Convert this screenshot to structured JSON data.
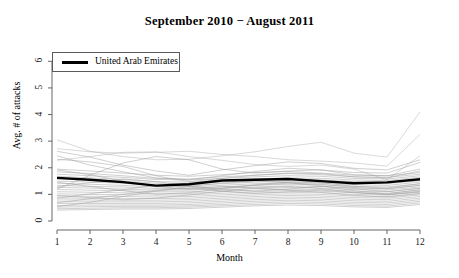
{
  "chart_data": {
    "type": "line",
    "title": "September 2010 − August 2011",
    "xlabel": "Month",
    "ylabel": "Avg. # of attacks",
    "xlim": [
      1,
      12
    ],
    "ylim": [
      0,
      6.5
    ],
    "xticks": [
      "1",
      "2",
      "3",
      "4",
      "5",
      "6",
      "7",
      "8",
      "9",
      "10",
      "11",
      "12"
    ],
    "yticks": [
      "0",
      "1",
      "2",
      "3",
      "4",
      "5",
      "6"
    ],
    "grid": false,
    "legend": {
      "position": "top-left",
      "entries": [
        {
          "label": "United Arab Emirates",
          "color": "#000000",
          "width": 2.5
        }
      ]
    },
    "x": [
      1,
      2,
      3,
      4,
      5,
      6,
      7,
      8,
      9,
      10,
      11,
      12
    ],
    "highlight_series": {
      "name": "United Arab Emirates",
      "color": "#000000",
      "values": [
        1.62,
        1.55,
        1.46,
        1.33,
        1.38,
        1.52,
        1.55,
        1.58,
        1.5,
        1.42,
        1.45,
        1.57
      ]
    },
    "background_series": [
      {
        "name": "bg-01",
        "values": [
          3.05,
          2.62,
          2.42,
          2.3,
          2.32,
          2.45,
          2.6,
          2.8,
          2.96,
          2.55,
          2.4,
          4.1
        ]
      },
      {
        "name": "bg-02",
        "values": [
          2.72,
          2.6,
          2.55,
          2.58,
          2.62,
          2.5,
          2.42,
          2.3,
          2.25,
          2.18,
          2.06,
          3.25
        ]
      },
      {
        "name": "bg-03",
        "values": [
          2.28,
          2.42,
          2.58,
          2.6,
          2.42,
          2.28,
          2.12,
          2.05,
          2.1,
          1.95,
          1.55,
          2.45
        ]
      },
      {
        "name": "bg-04",
        "values": [
          2.62,
          2.4,
          2.1,
          1.88,
          1.72,
          1.92,
          2.08,
          2.22,
          2.16,
          1.98,
          1.92,
          2.3
        ]
      },
      {
        "name": "bg-05",
        "values": [
          2.45,
          2.1,
          1.85,
          1.62,
          1.55,
          1.7,
          1.86,
          1.98,
          1.92,
          1.82,
          1.8,
          2.2
        ]
      },
      {
        "name": "bg-06",
        "values": [
          1.2,
          1.72,
          2.18,
          2.42,
          2.3,
          1.95,
          1.8,
          1.88,
          1.92,
          1.74,
          1.7,
          1.95
        ]
      },
      {
        "name": "bg-07",
        "values": [
          2.32,
          2.22,
          2.05,
          1.7,
          1.48,
          1.6,
          1.72,
          1.8,
          1.78,
          1.66,
          1.62,
          1.88
        ]
      },
      {
        "name": "bg-08",
        "values": [
          1.95,
          1.88,
          1.8,
          1.72,
          1.68,
          1.74,
          1.82,
          1.86,
          1.8,
          1.72,
          1.7,
          1.82
        ]
      },
      {
        "name": "bg-09",
        "values": [
          1.85,
          1.78,
          1.7,
          1.6,
          1.58,
          1.66,
          1.72,
          1.78,
          1.74,
          1.66,
          1.64,
          1.76
        ]
      },
      {
        "name": "bg-10",
        "values": [
          1.76,
          1.7,
          1.64,
          1.56,
          1.54,
          1.6,
          1.66,
          1.7,
          1.68,
          1.6,
          1.58,
          1.7
        ]
      },
      {
        "name": "bg-11",
        "values": [
          1.68,
          1.62,
          1.56,
          1.48,
          1.46,
          1.52,
          1.58,
          1.62,
          1.6,
          1.54,
          1.52,
          1.64
        ]
      },
      {
        "name": "bg-12",
        "values": [
          1.58,
          1.54,
          1.5,
          1.42,
          1.4,
          1.46,
          1.52,
          1.56,
          1.54,
          1.48,
          1.46,
          1.58
        ]
      },
      {
        "name": "bg-13",
        "values": [
          1.5,
          1.46,
          1.42,
          1.34,
          1.34,
          1.4,
          1.46,
          1.5,
          1.48,
          1.42,
          1.4,
          1.52
        ]
      },
      {
        "name": "bg-14",
        "values": [
          1.42,
          1.38,
          1.34,
          1.28,
          1.28,
          1.34,
          1.4,
          1.44,
          1.42,
          1.36,
          1.34,
          1.46
        ]
      },
      {
        "name": "bg-15",
        "values": [
          1.34,
          1.3,
          1.28,
          1.22,
          1.22,
          1.28,
          1.34,
          1.38,
          1.36,
          1.3,
          1.28,
          1.4
        ]
      },
      {
        "name": "bg-16",
        "values": [
          1.26,
          1.24,
          1.2,
          1.16,
          1.16,
          1.22,
          1.28,
          1.32,
          1.3,
          1.24,
          1.22,
          1.34
        ]
      },
      {
        "name": "bg-17",
        "values": [
          1.18,
          1.16,
          1.14,
          1.1,
          1.1,
          1.16,
          1.22,
          1.26,
          1.24,
          1.18,
          1.16,
          1.28
        ]
      },
      {
        "name": "bg-18",
        "values": [
          1.1,
          1.08,
          1.06,
          1.04,
          1.04,
          1.1,
          1.16,
          1.2,
          1.18,
          1.12,
          1.1,
          1.22
        ]
      },
      {
        "name": "bg-19",
        "values": [
          1.02,
          1.0,
          0.99,
          0.97,
          0.98,
          1.04,
          1.1,
          1.14,
          1.12,
          1.06,
          1.04,
          1.16
        ]
      },
      {
        "name": "bg-20",
        "values": [
          0.94,
          0.93,
          0.92,
          0.9,
          0.92,
          0.98,
          1.04,
          1.08,
          1.06,
          1.0,
          0.98,
          1.1
        ]
      },
      {
        "name": "bg-21",
        "values": [
          0.86,
          0.86,
          0.85,
          0.84,
          0.86,
          0.92,
          0.98,
          1.02,
          1.0,
          0.94,
          0.92,
          1.04
        ]
      },
      {
        "name": "bg-22",
        "values": [
          0.79,
          0.79,
          0.78,
          0.78,
          0.8,
          0.86,
          0.92,
          0.96,
          0.94,
          0.88,
          0.86,
          0.98
        ]
      },
      {
        "name": "bg-23",
        "values": [
          0.72,
          0.72,
          0.72,
          0.72,
          0.74,
          0.8,
          0.86,
          0.9,
          0.88,
          0.82,
          0.8,
          0.92
        ]
      },
      {
        "name": "bg-24",
        "values": [
          0.65,
          0.66,
          0.66,
          0.66,
          0.68,
          0.74,
          0.8,
          0.84,
          0.82,
          0.76,
          0.74,
          0.86
        ]
      },
      {
        "name": "bg-25",
        "values": [
          0.58,
          0.6,
          0.6,
          0.6,
          0.62,
          0.68,
          0.74,
          0.78,
          0.76,
          0.7,
          0.68,
          0.8
        ]
      },
      {
        "name": "bg-26",
        "values": [
          0.52,
          0.54,
          0.55,
          0.55,
          0.57,
          0.62,
          0.68,
          0.72,
          0.7,
          0.64,
          0.62,
          0.74
        ]
      },
      {
        "name": "bg-27",
        "values": [
          0.46,
          0.48,
          0.5,
          0.5,
          0.52,
          0.57,
          0.62,
          0.66,
          0.64,
          0.58,
          0.56,
          0.68
        ]
      },
      {
        "name": "bg-28",
        "values": [
          0.41,
          0.43,
          0.45,
          0.45,
          0.47,
          0.52,
          0.57,
          0.6,
          0.58,
          0.53,
          0.51,
          0.62
        ]
      },
      {
        "name": "bg-29",
        "values": [
          0.86,
          1.02,
          1.18,
          1.34,
          1.28,
          1.12,
          1.04,
          1.1,
          1.16,
          1.06,
          1.0,
          1.12
        ]
      },
      {
        "name": "bg-30",
        "values": [
          1.46,
          1.3,
          1.14,
          1.0,
          1.06,
          1.22,
          1.34,
          1.42,
          1.38,
          1.26,
          1.2,
          1.34
        ]
      },
      {
        "name": "bg-31",
        "values": [
          0.68,
          0.84,
          1.0,
          1.16,
          1.22,
          1.3,
          1.24,
          1.16,
          1.08,
          0.96,
          0.9,
          1.02
        ]
      },
      {
        "name": "bg-32",
        "values": [
          1.92,
          1.74,
          1.5,
          1.3,
          1.18,
          1.24,
          1.36,
          1.46,
          1.44,
          1.3,
          1.24,
          1.4
        ]
      },
      {
        "name": "bg-33",
        "values": [
          0.54,
          0.7,
          0.92,
          1.12,
          1.3,
          1.42,
          1.5,
          1.44,
          1.32,
          1.14,
          1.02,
          1.18
        ]
      },
      {
        "name": "bg-34",
        "values": [
          1.28,
          1.44,
          1.58,
          1.48,
          1.32,
          1.18,
          1.12,
          1.2,
          1.3,
          1.22,
          1.1,
          1.24
        ]
      },
      {
        "name": "bg-35",
        "values": [
          0.96,
          0.88,
          0.8,
          0.86,
          0.98,
          1.12,
          1.24,
          1.3,
          1.22,
          1.08,
          0.98,
          1.08
        ]
      }
    ]
  }
}
